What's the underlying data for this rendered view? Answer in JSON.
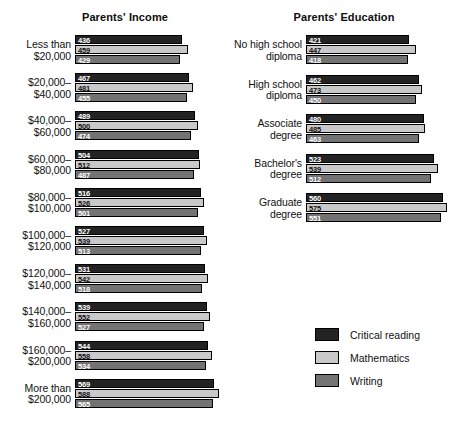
{
  "chart_data": {
    "type": "bar",
    "orientation": "horizontal",
    "title": "",
    "xlabel": "",
    "ylabel": "",
    "grid": false,
    "legend_position": "bottom-right",
    "value_labels": true,
    "xlim": [
      0,
      600
    ],
    "legend": [
      "Critical reading",
      "Mathematics",
      "Writing"
    ],
    "series_colors": [
      "#232323",
      "#c9c9c9",
      "#737373"
    ],
    "panels": [
      {
        "key": "income",
        "title": "Parents' Income",
        "categories": [
          "Less than\n$20,000",
          "$20,000–\n$40,000",
          "$40,000–\n$60,000",
          "$60,000–\n$80,000",
          "$80,000–\n$100,000",
          "$100,000–\n$120,000",
          "$120,000–\n$140,000",
          "$140,000–\n$160,000",
          "$160,000–\n$200,000",
          "More than\n$200,000"
        ],
        "series": [
          {
            "name": "Critical reading",
            "values": [
              436,
              467,
              489,
              504,
              516,
              527,
              531,
              539,
              544,
              569
            ]
          },
          {
            "name": "Mathematics",
            "values": [
              459,
              481,
              500,
              512,
              526,
              539,
              542,
              552,
              558,
              588
            ]
          },
          {
            "name": "Writing",
            "values": [
              429,
              455,
              474,
              487,
              501,
              513,
              518,
              527,
              534,
              565
            ]
          }
        ]
      },
      {
        "key": "education",
        "title": "Parents' Education",
        "categories": [
          "No high school\ndiploma",
          "High school\ndiploma",
          "Associate\ndegree",
          "Bachelor's\ndegree",
          "Graduate\ndegree"
        ],
        "series": [
          {
            "name": "Critical reading",
            "values": [
              421,
              462,
              480,
              523,
              560
            ]
          },
          {
            "name": "Mathematics",
            "values": [
              447,
              473,
              485,
              539,
              575
            ]
          },
          {
            "name": "Writing",
            "values": [
              418,
              450,
              463,
              512,
              551
            ]
          }
        ]
      }
    ]
  },
  "legend": {
    "items": [
      {
        "label": "Critical reading",
        "color": "#232323"
      },
      {
        "label": "Mathematics",
        "color": "#c9c9c9"
      },
      {
        "label": "Writing",
        "color": "#737373"
      }
    ]
  }
}
